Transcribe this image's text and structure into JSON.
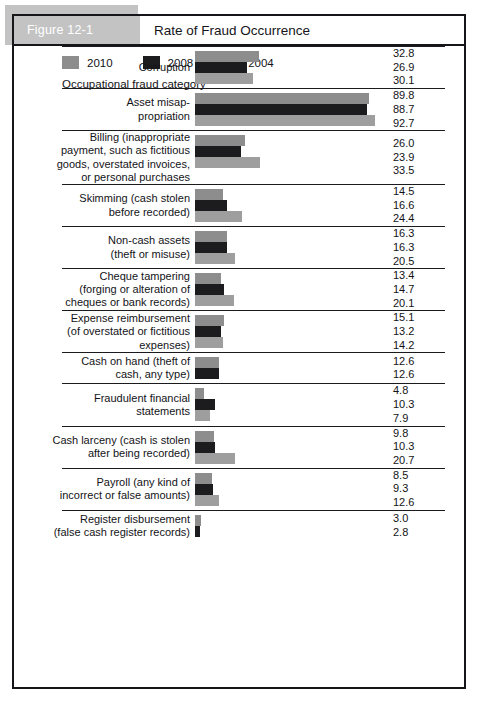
{
  "figure": {
    "tag": "Figure 12-1",
    "title": "Rate of Fraud Occurrence",
    "caption": "Occupational fraud category"
  },
  "legend": {
    "items": [
      {
        "label": "2010",
        "color": "#8d8d8d",
        "key": "y2010"
      },
      {
        "label": "2008",
        "color": "#1c1c1e",
        "key": "y2008"
      },
      {
        "label": "2004",
        "color": "#9e9e9e",
        "key": "y2004"
      }
    ]
  },
  "chart_data": {
    "type": "bar",
    "title": "Rate of Fraud Occurrence",
    "xlabel": "Occupational fraud category",
    "ylabel": "",
    "orientation": "horizontal",
    "grid": false,
    "legend_position": "bottom-left",
    "xlim": [
      0,
      92.7
    ],
    "series": [
      {
        "name": "2010",
        "color": "#8d8d8d"
      },
      {
        "name": "2008",
        "color": "#1c1c1e"
      },
      {
        "name": "2004",
        "color": "#9e9e9e"
      }
    ],
    "categories": [
      "Corruption",
      "Asset misappropriation",
      "Billing (inappropriate payment, such as fictitious goods, overstated invoices, or personal purchases)",
      "Skimming (cash stolen before recorded)",
      "Non-cash assets (theft or misuse)",
      "Cheque tampering (forging or alteration of cheques or bank records)",
      "Expense reimbursement (of overstated or fictitious expenses)",
      "Cash on hand (theft of cash, any type)",
      "Fraudulent financial statements",
      "Cash larceny (cash is stolen after being recorded)",
      "Payroll (any kind of incorrect or false amounts)",
      "Register disbursement (false cash register records)"
    ],
    "rows": [
      {
        "label_lines": [
          "Corruption"
        ],
        "values": [
          32.8,
          26.9,
          30.1
        ],
        "value_labels": [
          "32.8",
          "26.9",
          "30.1"
        ]
      },
      {
        "label_lines": [
          "Asset misap-",
          "propriation"
        ],
        "values": [
          89.8,
          88.7,
          92.7
        ],
        "value_labels": [
          "89.8",
          "88.7",
          "92.7"
        ]
      },
      {
        "label_lines": [
          "Billing (inappropriate",
          "payment, such as fictitious",
          "goods, overstated invoices,",
          "or personal purchases"
        ],
        "values": [
          26.0,
          23.9,
          33.5
        ],
        "value_labels": [
          "26.0",
          "23.9",
          "33.5"
        ]
      },
      {
        "label_lines": [
          "Skimming (cash stolen",
          "before recorded)"
        ],
        "values": [
          14.5,
          16.6,
          24.4
        ],
        "value_labels": [
          "14.5",
          "16.6",
          "24.4"
        ]
      },
      {
        "label_lines": [
          "Non-cash assets",
          "(theft or misuse)"
        ],
        "values": [
          16.3,
          16.3,
          20.5
        ],
        "value_labels": [
          "16.3",
          "16.3",
          "20.5"
        ]
      },
      {
        "label_lines": [
          "Cheque tampering",
          "(forging or alteration of",
          "cheques or bank records)"
        ],
        "values": [
          13.4,
          14.7,
          20.1
        ],
        "value_labels": [
          "13.4",
          "14.7",
          "20.1"
        ]
      },
      {
        "label_lines": [
          "Expense reimbursement",
          "(of overstated or fictitious",
          "expenses)"
        ],
        "values": [
          15.1,
          13.2,
          14.2
        ],
        "value_labels": [
          "15.1",
          "13.2",
          "14.2"
        ]
      },
      {
        "label_lines": [
          "Cash on hand (theft of",
          "cash, any type)"
        ],
        "values": [
          12.6,
          12.6
        ],
        "value_labels": [
          "12.6",
          "12.6"
        ]
      },
      {
        "label_lines": [
          "Fraudulent financial",
          "statements"
        ],
        "values": [
          4.8,
          10.3,
          7.9
        ],
        "value_labels": [
          "4.8",
          "10.3",
          "7.9"
        ]
      },
      {
        "label_lines": [
          "Cash larceny (cash is stolen",
          "after being recorded)"
        ],
        "values": [
          9.8,
          10.3,
          20.7
        ],
        "value_labels": [
          "9.8",
          "10.3",
          "20.7"
        ]
      },
      {
        "label_lines": [
          "Payroll (any kind of",
          "incorrect or false amounts)"
        ],
        "values": [
          8.5,
          9.3,
          12.6
        ],
        "value_labels": [
          "8.5",
          "9.3",
          "12.6"
        ]
      },
      {
        "label_lines": [
          "Register disbursement",
          "(false cash register records)"
        ],
        "values": [
          3.0,
          2.8
        ],
        "value_labels": [
          "3.0",
          "2.8"
        ]
      }
    ]
  }
}
